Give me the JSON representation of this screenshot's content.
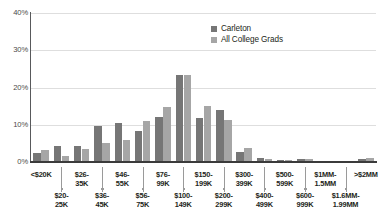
{
  "chart_data": {
    "type": "bar",
    "title": "",
    "subtitle": "",
    "xlabel": "",
    "ylabel": "",
    "ylim": [
      0,
      40
    ],
    "y_ticks": [
      "0%",
      "10%",
      "20%",
      "30%",
      "40%"
    ],
    "y_tick_values": [
      0,
      10,
      20,
      30,
      40
    ],
    "grid": "horizontal",
    "legend_position": "top-right",
    "categories": [
      "<$20K",
      "$20-25K",
      "$26-35K",
      "$36-45K",
      "$46-55K",
      "$56-75K",
      "$76-99K",
      "$100-149K",
      "$150-199K",
      "$200-299K",
      "$300-399K",
      "$400-499K",
      "$500-599K",
      "$600-999K",
      "$1MM-1.5MM",
      "$1.6MM-1.99MM",
      ">$2MM"
    ],
    "category_labels_row1": [
      "<$20K",
      "$26-\n35K",
      "$46-\n55K",
      "$76-\n99K",
      "$150-\n199K",
      "$300-\n399K",
      "$500-\n599K",
      "$1MM-\n1.5MM",
      ">$2MM"
    ],
    "category_labels_row2": [
      "$20-\n25K",
      "$36-\n45K",
      "$56-\n75K",
      "$100-\n149K",
      "$200-\n299K",
      "$400-\n499K",
      "$600-\n999K",
      "$1.6MM-\n1.99MM"
    ],
    "series": [
      {
        "name": "Carleton",
        "color": "#767676",
        "values": [
          2.5,
          4.3,
          4.3,
          9.8,
          10.6,
          8.3,
          12.2,
          23.3,
          11.8,
          14.0,
          2.8,
          1.0,
          0.6,
          0.8,
          0.4,
          0.2,
          0.9
        ]
      },
      {
        "name": "All College Grads",
        "color": "#a6a6a6",
        "values": [
          3.2,
          1.7,
          3.6,
          5.0,
          6.0,
          11.0,
          14.7,
          23.3,
          15.0,
          11.3,
          3.8,
          0.9,
          0.5,
          0.7,
          0.4,
          0.2,
          1.0
        ]
      }
    ]
  },
  "legend": {
    "items": [
      {
        "label": "Carleton",
        "color": "#767676"
      },
      {
        "label": "All College Grads",
        "color": "#a6a6a6"
      }
    ]
  },
  "axis_labels": {
    "x_tick_rows": [
      {
        "row": "top",
        "text": "<$20K"
      },
      {
        "row": "bot",
        "text": "$20-\n25K"
      },
      {
        "row": "top",
        "text": "$26-\n35K"
      },
      {
        "row": "bot",
        "text": "$36-\n45K"
      },
      {
        "row": "top",
        "text": "$46-\n55K"
      },
      {
        "row": "bot",
        "text": "$56-\n75K"
      },
      {
        "row": "top",
        "text": "$76-\n99K"
      },
      {
        "row": "bot",
        "text": "$100-\n149K"
      },
      {
        "row": "top",
        "text": "$150-\n199K"
      },
      {
        "row": "bot",
        "text": "$200-\n299K"
      },
      {
        "row": "top",
        "text": "$300-\n399K"
      },
      {
        "row": "bot",
        "text": "$400-\n499K"
      },
      {
        "row": "top",
        "text": "$500-\n599K"
      },
      {
        "row": "bot",
        "text": "$600-\n999K"
      },
      {
        "row": "top",
        "text": "$1MM-\n1.5MM"
      },
      {
        "row": "bot",
        "text": "$1.6MM-\n1.99MM"
      },
      {
        "row": "top",
        "text": ">$2MM"
      }
    ]
  },
  "colors": {
    "series_carleton": "#767676",
    "series_allgrads": "#a6a6a6",
    "gridline": "#dedede",
    "axis": "#3b3b3b",
    "text": "#231f20",
    "tick_label": "#4a4a4a",
    "background": "#ffffff"
  }
}
